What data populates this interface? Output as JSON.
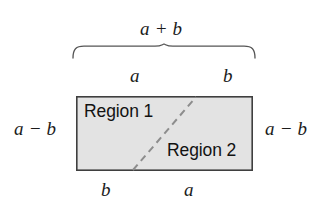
{
  "figure": {
    "canvas": {
      "width": 325,
      "height": 208,
      "background": "#ffffff"
    },
    "rectangle": {
      "x": 76,
      "y": 96,
      "width": 177,
      "height": 75,
      "fill": "#e3e3e3",
      "stroke": "#3f3f3f",
      "stroke_width": 1.6
    },
    "diagonal": {
      "x1": 133,
      "y1": 170,
      "x2": 196,
      "y2": 97,
      "stroke": "#8d8d8d",
      "stroke_width": 2,
      "dash": "7 5",
      "style": "dashed"
    },
    "brace": {
      "left_x": 73,
      "right_x": 255,
      "tip_x": 164,
      "top_y": 44,
      "arm_y": 58,
      "stroke": "#555555",
      "stroke_width": 1.3
    }
  },
  "labels": {
    "top_sum": {
      "text": "a + b",
      "name": "label-a-plus-b"
    },
    "top_left": {
      "text": "a",
      "name": "label-top-a"
    },
    "top_right": {
      "text": "b",
      "name": "label-top-b"
    },
    "left_side": {
      "text": "a − b",
      "name": "label-left-a-minus-b"
    },
    "right_side": {
      "text": "a − b",
      "name": "label-right-a-minus-b"
    },
    "bottom_left": {
      "text": "b",
      "name": "label-bottom-b"
    },
    "bottom_right": {
      "text": "a",
      "name": "label-bottom-a"
    },
    "region_one": {
      "text": "Region 1",
      "name": "label-region-1"
    },
    "region_two": {
      "text": "Region 2",
      "name": "label-region-2"
    }
  },
  "colors": {
    "background": "#ffffff",
    "rect_fill": "#e3e3e3",
    "rect_stroke": "#3f3f3f",
    "dashed_line": "#8d8d8d",
    "brace_stroke": "#555555",
    "text": "#1b1b1b"
  }
}
